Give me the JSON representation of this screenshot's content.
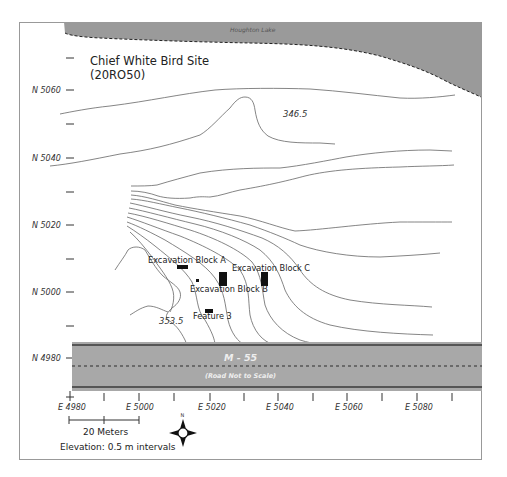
{
  "map": {
    "title_line1": "Chief White Bird Site",
    "title_line2": "(20RO50)",
    "lake_label": "Houghton Lake",
    "road_label": "M - 55",
    "road_sublabel": "(Road Not to Scale)",
    "colors": {
      "lake": "#9a9a9a",
      "road": "#a8a8a8",
      "road_edge": "#555555",
      "contour": "#666666",
      "frame": "#999999",
      "feature": "#111111"
    }
  },
  "axes": {
    "northing_labels": [
      "N 5060",
      "N 5040",
      "N 5020",
      "N 5000",
      "N 4980"
    ],
    "easting_labels": [
      "E 4980",
      "E 5000",
      "E 5020",
      "E 5040",
      "E 5060",
      "E 5080"
    ]
  },
  "contour_labels": {
    "upper": "346.5",
    "lower": "353.5"
  },
  "features": [
    {
      "label": "Excavation Block A"
    },
    {
      "label": "Excavation Block B"
    },
    {
      "label": "Excavation Block C"
    },
    {
      "label": "Feature 3"
    }
  ],
  "legend": {
    "scale_label": "20 Meters",
    "elevation_note": "Elevation: 0.5 m intervals",
    "north_label": "N"
  }
}
